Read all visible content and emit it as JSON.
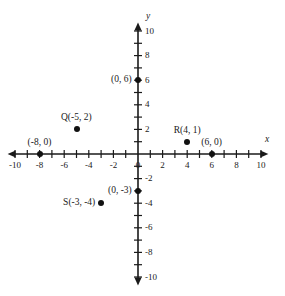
{
  "figure": {
    "type": "coordinate-plane",
    "background_color": "#ffffff",
    "ink_color": "#1a1a1a",
    "origin_px": {
      "x": 138,
      "y": 154
    },
    "unit_px": 12.3,
    "x_axis": {
      "name": "x",
      "min": -10.6,
      "max": 10.6,
      "tick_step": 1,
      "labeled_step": 2,
      "labels": [
        "-10",
        "-8",
        "-6",
        "-4",
        "-2",
        "0",
        "2",
        "4",
        "6",
        "8",
        "10"
      ],
      "label_values": [
        -10,
        -8,
        -6,
        -4,
        -2,
        0,
        2,
        4,
        6,
        8,
        10
      ],
      "arrows": [
        "left",
        "right"
      ]
    },
    "y_axis": {
      "name": "y",
      "min": -10.7,
      "max": 10.7,
      "tick_step": 1,
      "labeled_step": 2,
      "labels": [
        "10",
        "8",
        "6",
        "4",
        "2",
        "-2",
        "-4",
        "-6",
        "-8",
        "-10"
      ],
      "label_values": [
        10,
        8,
        6,
        4,
        2,
        -2,
        -4,
        -6,
        -8,
        -10
      ],
      "arrows": [
        "up",
        "down"
      ]
    },
    "points": [
      {
        "id": "p-0-6",
        "name": "",
        "x": 0,
        "y": 6,
        "label": "(0, 6)",
        "label_pos": "left"
      },
      {
        "id": "p-Q",
        "name": "Q",
        "x": -5,
        "y": 2,
        "label": "Q(-5, 2)",
        "label_pos": "above"
      },
      {
        "id": "p-R",
        "name": "R",
        "x": 4,
        "y": 1,
        "label": "R(4, 1)",
        "label_pos": "above"
      },
      {
        "id": "p-6-0",
        "name": "",
        "x": 6,
        "y": 0,
        "label": "(6, 0)",
        "label_pos": "above"
      },
      {
        "id": "p-neg8-0",
        "name": "",
        "x": -8,
        "y": 0,
        "label": "(-8, 0)",
        "label_pos": "above"
      },
      {
        "id": "p-0-neg3",
        "name": "",
        "x": 0,
        "y": -3,
        "label": "(0, -3)",
        "label_pos": "left"
      },
      {
        "id": "p-S",
        "name": "S",
        "x": -3,
        "y": -4,
        "label": "S(-3, -4)",
        "label_pos": "left"
      }
    ]
  }
}
